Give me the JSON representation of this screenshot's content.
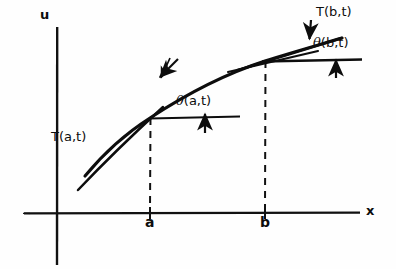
{
  "figure": {
    "kind": "hand-drawn-math-diagram",
    "ink_color": "#0d0d0d",
    "background_color": "#fefefe",
    "axes": {
      "vertical_label": "u",
      "horizontal_label": "x",
      "origin": {
        "x": 57,
        "y": 213
      },
      "vertical": {
        "x": 57,
        "y_top": 27,
        "y_bottom": 265
      },
      "horizontal": {
        "y": 213,
        "x_left": 24,
        "x_right": 360
      },
      "vertical_label_pos": {
        "x": 44,
        "y": 10
      },
      "horizontal_label_pos": {
        "x": 366,
        "y": 205
      }
    },
    "ticks": [
      {
        "label": "a",
        "x": 150,
        "label_pos": {
          "x": 146,
          "y": 215
        }
      },
      {
        "label": "b",
        "x": 265,
        "label_pos": {
          "x": 261,
          "y": 215
        }
      }
    ],
    "curve": {
      "name": "displacement-curve",
      "start": {
        "x": 85,
        "y": 176
      },
      "end": {
        "x": 342,
        "y": 38
      },
      "control_1": {
        "x": 150,
        "y": 118
      },
      "control_2": {
        "x": 265,
        "y": 61
      }
    },
    "dashed_drops": [
      {
        "label": "a",
        "x": 150,
        "y_top": 118,
        "y_bottom": 213
      },
      {
        "label": "b",
        "x": 265,
        "y_top": 61,
        "y_bottom": 213
      }
    ],
    "annotations": [
      {
        "id": "tension-a",
        "label": "T(a,t)",
        "label_pos": {
          "x": 52,
          "y": 131
        },
        "kind": "tangent-line",
        "note": "tangent line to curve at x = a, drawn through and below the curve"
      },
      {
        "id": "angle-a",
        "label_prefix": "θ",
        "label_suffix": "(a,t)",
        "label_pos": {
          "x": 177,
          "y": 95
        },
        "kind": "angle-between-tangent-and-horizontal",
        "note": "angle at point a between horizontal reference line and tangent"
      },
      {
        "id": "tension-b",
        "label": "T(b,t)",
        "label_pos": {
          "x": 316,
          "y": 6
        },
        "kind": "tangent-line",
        "note": "tangent line to curve at x = b, extended to the right"
      },
      {
        "id": "angle-b",
        "label_prefix": "θ",
        "label_suffix": "(b,t)",
        "label_pos": {
          "x": 314,
          "y": 37
        },
        "kind": "angle-between-tangent-and-horizontal",
        "note": "angle at point b between horizontal reference line and tangent"
      }
    ],
    "pointer_arrows": [
      {
        "id": "arrow-to-tangent-a",
        "from": {
          "x": 176,
          "y": 61
        },
        "to": {
          "x": 158,
          "y": 78
        },
        "direction": "down-left"
      },
      {
        "id": "arrow-to-tangent-b",
        "from": {
          "x": 312,
          "y": 22
        },
        "to": {
          "x": 310,
          "y": 39
        },
        "direction": "down"
      },
      {
        "id": "arrow-to-horizontal-a",
        "from": {
          "x": 205,
          "y": 131
        },
        "to": {
          "x": 205,
          "y": 113
        },
        "direction": "up"
      },
      {
        "id": "arrow-to-horizontal-b",
        "from": {
          "x": 336,
          "y": 77
        },
        "to": {
          "x": 336,
          "y": 60
        },
        "direction": "up"
      }
    ],
    "reference_lines": [
      {
        "id": "horizontal-ref-a",
        "x1": 150,
        "y1": 118,
        "x2": 240,
        "y2": 116
      },
      {
        "id": "horizontal-ref-b",
        "x1": 262,
        "y1": 61,
        "x2": 360,
        "y2": 59
      },
      {
        "id": "tangent-curve-b-upper",
        "x1": 228,
        "y1": 72,
        "x2": 318,
        "y2": 52
      }
    ]
  }
}
